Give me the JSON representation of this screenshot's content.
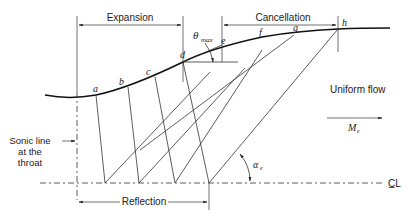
{
  "diagram": {
    "type": "nozzle-method-of-characteristics",
    "regions": {
      "expansion": "Expansion",
      "cancellation": "Cancellation",
      "reflection": "Reflection"
    },
    "wall_points": [
      "a",
      "b",
      "c",
      "d",
      "e",
      "f",
      "g",
      "h"
    ],
    "labels": {
      "theta_max": "θ",
      "theta_max_sub": "max",
      "uniform_flow": "Uniform flow",
      "mach_exit": "M",
      "mach_exit_sub": "e",
      "sonic_line_1": "Sonic line",
      "sonic_line_2": "at the",
      "sonic_line_3": "throat",
      "alpha_exit": "α",
      "alpha_exit_sub": "e",
      "centerline": "C̲L"
    }
  }
}
